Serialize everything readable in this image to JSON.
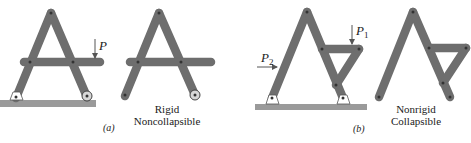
{
  "figure": {
    "panel_a": {
      "caption": "(a)",
      "load_label": "P",
      "description_line1": "Rigid",
      "description_line2": "Noncollapsible"
    },
    "panel_b": {
      "caption": "(b)",
      "load1_label": "P",
      "load1_subscript": "1",
      "load2_label": "P",
      "load2_subscript": "2",
      "description_line1": "Nonrigid",
      "description_line2": "Collapsible"
    },
    "colors": {
      "member_fill": "#c8c8c8",
      "member_stroke": "#6e6e6e",
      "ground": "#9a9a9a",
      "pin": "#333333"
    }
  }
}
